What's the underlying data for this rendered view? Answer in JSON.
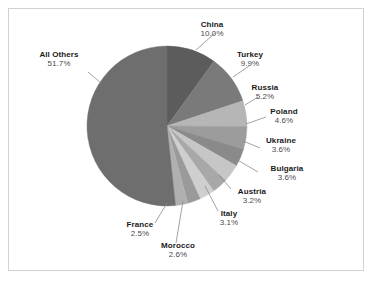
{
  "chart_data": {
    "type": "pie",
    "title": "",
    "subtitle": "",
    "xlabel": "",
    "ylabel": "",
    "legend_position": "none",
    "grid": false,
    "labels_show_percent": true,
    "start_angle_deg": 0,
    "direction": "clockwise",
    "categories": [
      "China",
      "Turkey",
      "Russia",
      "Poland",
      "Ukraine",
      "Bulgaria",
      "Austria",
      "Italy",
      "Morocco",
      "France",
      "All Others"
    ],
    "values": [
      10.0,
      9.9,
      5.2,
      4.6,
      3.6,
      3.6,
      3.2,
      3.1,
      2.6,
      2.5,
      51.7
    ],
    "units": "%",
    "slices": [
      {
        "name": "China",
        "value": 10.0,
        "value_text": "10.0%",
        "color": "#5c5c5c"
      },
      {
        "name": "Turkey",
        "value": 9.9,
        "value_text": "9.9%",
        "color": "#7a7a7a"
      },
      {
        "name": "Russia",
        "value": 5.2,
        "value_text": "5.2%",
        "color": "#b6b6b6"
      },
      {
        "name": "Poland",
        "value": 4.6,
        "value_text": "4.6%",
        "color": "#9c9c9c"
      },
      {
        "name": "Ukraine",
        "value": 3.6,
        "value_text": "3.6%",
        "color": "#8a8a8a"
      },
      {
        "name": "Bulgaria",
        "value": 3.6,
        "value_text": "3.6%",
        "color": "#c6c6c6"
      },
      {
        "name": "Austria",
        "value": 3.2,
        "value_text": "3.2%",
        "color": "#a8a8a8"
      },
      {
        "name": "Italy",
        "value": 3.1,
        "value_text": "3.1%",
        "color": "#cfcfcf"
      },
      {
        "name": "Morocco",
        "value": 2.6,
        "value_text": "2.6%",
        "color": "#9a9a9a"
      },
      {
        "name": "France",
        "value": 2.5,
        "value_text": "2.5%",
        "color": "#b0b0b0"
      },
      {
        "name": "All Others",
        "value": 51.7,
        "value_text": "51.7%",
        "color": "#6e6e6e"
      }
    ]
  },
  "labels": {
    "china": {
      "name": "China",
      "value": "10.0%"
    },
    "turkey": {
      "name": "Turkey",
      "value": "9.9%"
    },
    "russia": {
      "name": "Russia",
      "value": "5.2%"
    },
    "poland": {
      "name": "Poland",
      "value": "4.6%"
    },
    "ukraine": {
      "name": "Ukraine",
      "value": "3.6%"
    },
    "bulgaria": {
      "name": "Bulgaria",
      "value": "3.6%"
    },
    "austria": {
      "name": "Austria",
      "value": "3.2%"
    },
    "italy": {
      "name": "Italy",
      "value": "3.1%"
    },
    "morocco": {
      "name": "Morocco",
      "value": "2.6%"
    },
    "france": {
      "name": "France",
      "value": "2.5%"
    },
    "all_others": {
      "name": "All Others",
      "value": "51.7%"
    }
  },
  "style": {
    "background": "#ffffff",
    "border_color": "#d2d2d2",
    "leader_line_color": "#8c8c8c",
    "label_name_color": "#1a1a1a",
    "label_value_color": "#4a4a4a"
  },
  "geometry": {
    "center_x": 167,
    "center_y": 126,
    "radius": 80
  }
}
